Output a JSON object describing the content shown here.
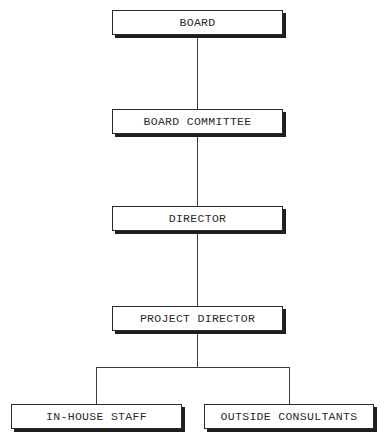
{
  "chart": {
    "type": "org-chart",
    "nodes": {
      "board": "BOARD",
      "board_committee": "BOARD COMMITTEE",
      "director": "DIRECTOR",
      "project_director": "PROJECT DIRECTOR",
      "in_house_staff": "IN-HOUSE STAFF",
      "outside_consultants": "OUTSIDE CONSULTANTS"
    },
    "hierarchy": [
      {
        "parent": "BOARD",
        "child": "BOARD COMMITTEE"
      },
      {
        "parent": "BOARD COMMITTEE",
        "child": "DIRECTOR"
      },
      {
        "parent": "DIRECTOR",
        "child": "PROJECT DIRECTOR"
      },
      {
        "parent": "PROJECT DIRECTOR",
        "child": "IN-HOUSE STAFF"
      },
      {
        "parent": "PROJECT DIRECTOR",
        "child": "OUTSIDE CONSULTANTS"
      }
    ]
  }
}
